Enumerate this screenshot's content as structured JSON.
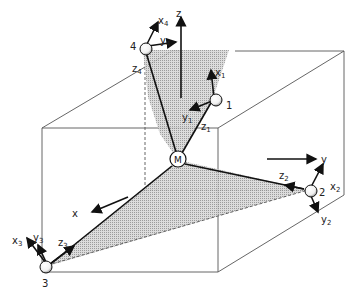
{
  "diagram": {
    "center_label": "M",
    "axes": {
      "z": "z",
      "y": "y",
      "x": "x"
    },
    "nodes": [
      {
        "id": "1",
        "label": "1",
        "vectors": {
          "x": "x",
          "x_sub": "1",
          "y": "y",
          "y_sub": "1",
          "z": "z",
          "z_sub": "1"
        }
      },
      {
        "id": "2",
        "label": "2",
        "vectors": {
          "x": "x",
          "x_sub": "2",
          "y": "y",
          "y_sub": "2",
          "z": "z",
          "z_sub": "2"
        }
      },
      {
        "id": "3",
        "label": "3",
        "vectors": {
          "x": "x",
          "x_sub": "3",
          "y": "y",
          "y_sub": "3",
          "z": "z",
          "z_sub": "3"
        }
      },
      {
        "id": "4",
        "label": "4",
        "vectors": {
          "x": "x",
          "x_sub": "4",
          "y": "y",
          "y_sub": "4",
          "z": "z",
          "z_sub": "4"
        }
      }
    ],
    "colors": {
      "fill": "#bdbdbd",
      "line": "#111111",
      "edge": "#555555"
    }
  }
}
